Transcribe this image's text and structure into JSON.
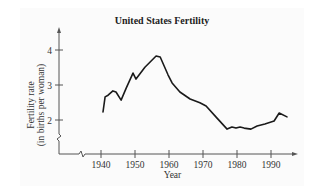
{
  "chart_data": {
    "type": "line",
    "title": "United States Fertility",
    "xlabel": "Year",
    "ylabel": "Fertility rate (in births per woman)",
    "ylabel_lines": [
      "Fertility rate",
      "(in births per woman)"
    ],
    "x_ticks": [
      1940,
      1950,
      1960,
      1970,
      1980,
      1990
    ],
    "y_ticks": [
      2,
      3,
      4
    ],
    "xlim": [
      1930,
      1997
    ],
    "ylim": [
      1.0,
      4.6
    ],
    "grid": false,
    "legend": null,
    "axis_breaks": {
      "x": true,
      "y": true
    },
    "series": [
      {
        "name": "Fertility rate",
        "x": [
          1940.6,
          1941.2,
          1942.1,
          1943.5,
          1944.4,
          1945.9,
          1947.4,
          1949.4,
          1950.3,
          1952.9,
          1956.2,
          1957.4,
          1959.7,
          1960.9,
          1963.2,
          1966.2,
          1969.1,
          1970.9,
          1973.8,
          1977.1,
          1978.5,
          1979.7,
          1980.9,
          1982.1,
          1984.1,
          1985.9,
          1988.2,
          1990.9,
          1992.4,
          1994.7
        ],
        "values": [
          2.23,
          2.66,
          2.71,
          2.83,
          2.8,
          2.57,
          2.91,
          3.34,
          3.17,
          3.51,
          3.83,
          3.8,
          3.29,
          3.06,
          2.8,
          2.6,
          2.49,
          2.4,
          2.09,
          1.74,
          1.8,
          1.77,
          1.8,
          1.77,
          1.74,
          1.83,
          1.89,
          1.97,
          2.2,
          2.09
        ]
      }
    ]
  },
  "colors": {
    "line": "#1a1a1a",
    "axis": "#555555",
    "background": "#fbfbfb"
  }
}
